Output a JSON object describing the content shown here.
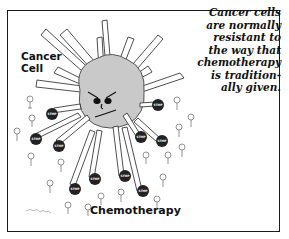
{
  "caption": {
    "lines": [
      "Cancer cells",
      "are normally",
      "resistant to",
      "the way that",
      "chemotherapy",
      "is tradition-",
      "ally given."
    ]
  },
  "labels": {
    "cancer_cell_line1": "Cancer",
    "cancer_cell_line2": "Cell",
    "chemotherapy": "Chemotherapy"
  },
  "stop_sign_text": "STOP",
  "colors": {
    "cell_fill": "#c9c9c9",
    "stop_fill": "#222222",
    "frame": "#1a1a1a"
  }
}
